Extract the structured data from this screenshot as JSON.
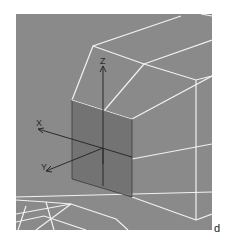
{
  "viewport": {
    "background_color": "#8a8a8a",
    "wire_color": "#f2f2f2",
    "plane_color": "#6f6f6f",
    "axis_color": "#2a2a2a"
  },
  "gizmo": {
    "axes": [
      {
        "name": "x",
        "label": "X"
      },
      {
        "name": "y",
        "label": "Y"
      },
      {
        "name": "z",
        "label": "Z"
      }
    ]
  },
  "figure_label": "d"
}
